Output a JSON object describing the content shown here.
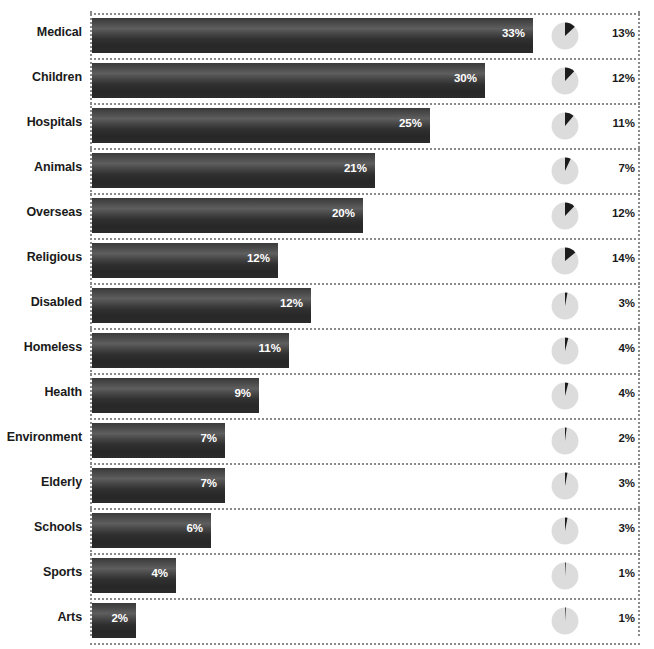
{
  "chart_title": "",
  "colors": {
    "bar_dark": "#2b2b2b",
    "bar_highlight": "#5e5e5e",
    "pie_background": "#dcdcdc",
    "pie_slice": "#1c1c1c",
    "label_text": "#1a1a1a",
    "bar_value_text": "#ffffff",
    "dotted_rule": "#8a8a8a",
    "page_background": "#ffffff"
  },
  "chart_data": {
    "type": "bar",
    "title": "",
    "subtitle": "",
    "xlabel": "",
    "ylabel": "",
    "grid": false,
    "legend": null,
    "orientation": "horizontal",
    "categories": [
      "Medical",
      "Children",
      "Hospitals",
      "Animals",
      "Overseas",
      "Religious",
      "Disabled",
      "Homeless",
      "Health",
      "Environment",
      "Elderly",
      "Schools",
      "Sports",
      "Arts"
    ],
    "series": [
      {
        "name": "Bar percentage",
        "role": "bar",
        "values": [
          33,
          30,
          25,
          21,
          20,
          12,
          12,
          11,
          9,
          7,
          7,
          6,
          4,
          2
        ],
        "labels": [
          "33%",
          "30%",
          "25%",
          "21%",
          "20%",
          "12%",
          "12%",
          "11%",
          "9%",
          "7%",
          "7%",
          "6%",
          "4%",
          "2%"
        ],
        "bar_pixel_widths": [
          441,
          393,
          338,
          283,
          271,
          186,
          219,
          197,
          167,
          133,
          133,
          119,
          84,
          44
        ]
      },
      {
        "name": "Pie percentage",
        "role": "pie",
        "values": [
          13,
          12,
          11,
          7,
          12,
          14,
          3,
          4,
          4,
          2,
          3,
          3,
          1,
          1
        ],
        "labels": [
          "13%",
          "12%",
          "11%",
          "7%",
          "12%",
          "14%",
          "3%",
          "4%",
          "4%",
          "2%",
          "3%",
          "3%",
          "1%",
          "1%"
        ]
      }
    ],
    "ylim": [
      0,
      33
    ]
  },
  "layout": {
    "row_height": 45,
    "first_row_top": 13,
    "bar_left": 92,
    "pie_left": 551,
    "side_value_left": 601
  }
}
